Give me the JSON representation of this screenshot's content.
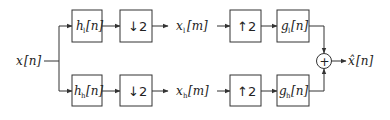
{
  "diagram": {
    "type": "two-channel filter bank",
    "input": {
      "label": "x[n]",
      "base": "x",
      "arg": "[n]"
    },
    "output": {
      "label": "x̂[n]",
      "base": "x̂",
      "arg": "[n]"
    },
    "top_branch": {
      "analysis_filter": {
        "label": "h_l[n]",
        "base": "h",
        "sub": "l",
        "arg": "[n]"
      },
      "downsampler": {
        "label": "↓2"
      },
      "signal": {
        "label": "x_l[m]",
        "base": "x",
        "sub": "l",
        "arg": "[m]"
      },
      "upsampler": {
        "label": "↑2"
      },
      "synthesis_filter": {
        "label": "g_l[n]",
        "base": "g",
        "sub": "l",
        "arg": "[n]"
      }
    },
    "bottom_branch": {
      "analysis_filter": {
        "label": "h_h[n]",
        "base": "h",
        "sub": "h",
        "arg": "[n]"
      },
      "downsampler": {
        "label": "↓2"
      },
      "signal": {
        "label": "x_h[m]",
        "base": "x",
        "sub": "h",
        "arg": "[m]"
      },
      "upsampler": {
        "label": "↑2"
      },
      "synthesis_filter": {
        "label": "g_h[n]",
        "base": "g",
        "sub": "h",
        "arg": "[n]"
      }
    },
    "summer": {
      "symbol": "+"
    }
  }
}
